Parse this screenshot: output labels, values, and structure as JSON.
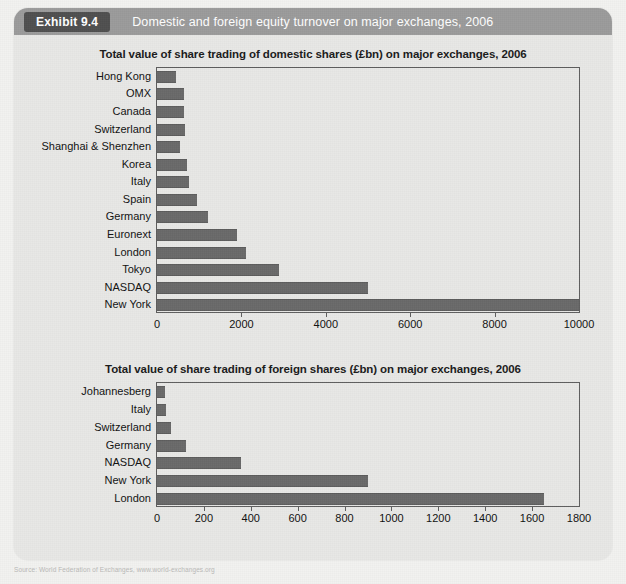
{
  "exhibit": {
    "badge": "Exhibit 9.4",
    "title": "Domestic and foreign equity turnover on major exchanges, 2006"
  },
  "source_note": "Source: World Federation of Exchanges, www.world-exchanges.org",
  "colors": {
    "bar": "#696969",
    "axis": "#5d5d5d",
    "panel": "#e8e8e6",
    "header": "#9b9b9b",
    "badge": "#4f4f4f",
    "text": "#111111"
  },
  "chart_data": [
    {
      "type": "bar",
      "orientation": "horizontal",
      "id": "domestic",
      "title": "Total value of share trading of domestic shares (£bn) on major exchanges, 2006",
      "xlabel": "",
      "ylabel": "",
      "xlim": [
        0,
        10000
      ],
      "xticks": [
        0,
        2000,
        4000,
        6000,
        8000,
        10000
      ],
      "xtick_labels": [
        "0",
        "2000",
        "4000",
        "6000",
        "8000",
        "10000"
      ],
      "grid": false,
      "legend": false,
      "categories": [
        "Hong Kong",
        "OMX",
        "Canada",
        "Switzerland",
        "Shanghai & Shenzhen",
        "Korea",
        "Italy",
        "Spain",
        "Germany",
        "Euronext",
        "London",
        "Tokyo",
        "NASDAQ",
        "New York"
      ],
      "values": [
        450,
        630,
        650,
        660,
        540,
        700,
        760,
        950,
        1200,
        1900,
        2120,
        2900,
        5000,
        10000
      ]
    },
    {
      "type": "bar",
      "orientation": "horizontal",
      "id": "foreign",
      "title": "Total value of share trading of foreign shares (£bn) on major exchanges, 2006",
      "xlabel": "",
      "ylabel": "",
      "xlim": [
        0,
        1800
      ],
      "xticks": [
        0,
        200,
        400,
        600,
        800,
        1000,
        1200,
        1400,
        1600,
        1800
      ],
      "xtick_labels": [
        "0",
        "200",
        "400",
        "600",
        "800",
        "1000",
        "1200",
        "1400",
        "1600",
        "1800"
      ],
      "grid": false,
      "legend": false,
      "categories": [
        "Johannesberg",
        "Italy",
        "Switzerland",
        "Germany",
        "NASDAQ",
        "New York",
        "London"
      ],
      "values": [
        35,
        40,
        60,
        125,
        360,
        900,
        1650
      ]
    }
  ]
}
